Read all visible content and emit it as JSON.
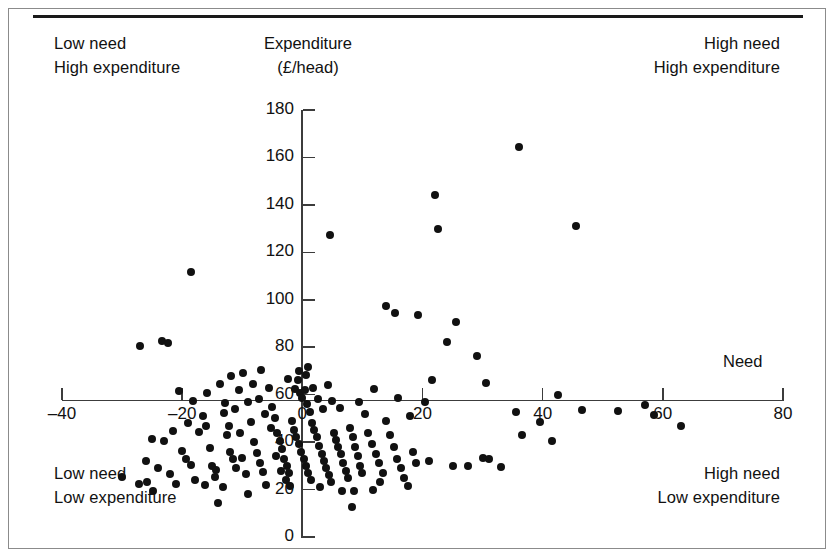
{
  "figure": {
    "annotations": {
      "top_left": [
        "Low need",
        "High expenditure"
      ],
      "top_right": [
        "High need",
        "High expenditure"
      ],
      "bottom_left": [
        "Low need",
        "Low expenditure"
      ],
      "bottom_right": [
        "High need",
        "Low expenditure"
      ]
    },
    "y_axis_title_line1": "Expenditure",
    "y_axis_title_line2": "(£/head)",
    "x_axis_title": "Need",
    "colors": {
      "marker": "#111111",
      "axis": "#3c3c3c",
      "rule": "#1a1a1a",
      "frame": "#8b8b8b",
      "background": "#ffffff"
    }
  },
  "chart_data": {
    "type": "scatter",
    "title": "",
    "xlabel": "Need",
    "ylabel": "Expenditure (£/head)",
    "xlim": [
      -40,
      80
    ],
    "ylim": [
      0,
      180
    ],
    "xticks": [
      -40,
      -20,
      0,
      20,
      40,
      60,
      80
    ],
    "xtick_labels": [
      "–40",
      "–20",
      "0",
      "20",
      "40",
      "60",
      "80"
    ],
    "yticks": [
      0,
      20,
      40,
      60,
      80,
      100,
      120,
      140,
      160,
      180
    ],
    "ytick_labels": [
      "0",
      "20",
      "40",
      "60",
      "80",
      "100",
      "120",
      "140",
      "160",
      "180"
    ],
    "grid": false,
    "legend": null,
    "quadrant_origin": {
      "x": 0,
      "y": 50
    },
    "series": [
      {
        "name": "Health authorities",
        "marker": "filled-circle",
        "color": "#111111",
        "points": [
          [
            -27.0,
            80.5
          ],
          [
            -23.4,
            82.5
          ],
          [
            -22.3,
            81.8
          ],
          [
            -18.6,
            111.5
          ],
          [
            -19.0,
            48.0
          ],
          [
            -25.1,
            41.5
          ],
          [
            -23.0,
            40.6
          ],
          [
            -21.5,
            44.8
          ],
          [
            -20.0,
            36.4
          ],
          [
            -19.3,
            33.0
          ],
          [
            -18.5,
            30.5
          ],
          [
            -17.2,
            44.4
          ],
          [
            -16.6,
            50.8
          ],
          [
            -16.0,
            47.0
          ],
          [
            -15.4,
            37.6
          ],
          [
            -15.0,
            30.0
          ],
          [
            -14.3,
            28.2
          ],
          [
            -13.7,
            64.5
          ],
          [
            -13.0,
            52.3
          ],
          [
            -12.5,
            43.1
          ],
          [
            -12.0,
            36.0
          ],
          [
            -11.6,
            32.8
          ],
          [
            -11.0,
            29.0
          ],
          [
            -10.3,
            43.9
          ],
          [
            -10.0,
            33.5
          ],
          [
            -9.4,
            26.5
          ],
          [
            -9.0,
            57.0
          ],
          [
            -8.6,
            48.5
          ],
          [
            -8.0,
            40.0
          ],
          [
            -7.6,
            35.6
          ],
          [
            -7.0,
            31.0
          ],
          [
            -6.5,
            27.2
          ],
          [
            -6.0,
            22.0
          ],
          [
            -5.5,
            63.0
          ],
          [
            -5.0,
            55.0
          ],
          [
            -4.6,
            50.0
          ],
          [
            -4.2,
            44.0
          ],
          [
            -3.8,
            40.5
          ],
          [
            -3.4,
            37.0
          ],
          [
            -3.0,
            33.0
          ],
          [
            -2.6,
            30.0
          ],
          [
            -2.2,
            26.8
          ],
          [
            -1.8,
            49.0
          ],
          [
            -1.4,
            45.0
          ],
          [
            -1.0,
            42.0
          ],
          [
            -0.6,
            39.0
          ],
          [
            -0.2,
            36.0
          ],
          [
            0.2,
            33.0
          ],
          [
            0.6,
            30.0
          ],
          [
            1.0,
            27.0
          ],
          [
            1.4,
            24.0
          ],
          [
            -0.4,
            60.5
          ],
          [
            0.0,
            58.5
          ],
          [
            0.4,
            62.0
          ],
          [
            0.8,
            56.0
          ],
          [
            1.2,
            52.5
          ],
          [
            1.6,
            48.0
          ],
          [
            2.0,
            45.0
          ],
          [
            2.4,
            42.0
          ],
          [
            2.8,
            38.5
          ],
          [
            3.2,
            35.0
          ],
          [
            3.6,
            32.0
          ],
          [
            4.0,
            29.0
          ],
          [
            4.4,
            26.0
          ],
          [
            4.8,
            23.0
          ],
          [
            5.2,
            44.0
          ],
          [
            5.6,
            41.0
          ],
          [
            6.0,
            38.0
          ],
          [
            6.4,
            35.0
          ],
          [
            6.8,
            31.0
          ],
          [
            7.2,
            28.0
          ],
          [
            7.6,
            25.0
          ],
          [
            8.0,
            46.0
          ],
          [
            8.4,
            42.0
          ],
          [
            8.8,
            38.0
          ],
          [
            9.2,
            34.0
          ],
          [
            9.6,
            30.0
          ],
          [
            10.0,
            27.0
          ],
          [
            10.4,
            52.0
          ],
          [
            11.0,
            44.0
          ],
          [
            11.6,
            39.0
          ],
          [
            12.2,
            35.0
          ],
          [
            12.8,
            31.0
          ],
          [
            13.4,
            27.0
          ],
          [
            14.0,
            49.0
          ],
          [
            14.6,
            43.0
          ],
          [
            15.2,
            38.0
          ],
          [
            15.8,
            33.0
          ],
          [
            16.4,
            29.0
          ],
          [
            17.0,
            25.0
          ],
          [
            17.6,
            21.5
          ],
          [
            18.4,
            36.0
          ],
          [
            19.0,
            31.0
          ],
          [
            20.4,
            57.0
          ],
          [
            21.0,
            32.0
          ],
          [
            -24.0,
            29.0
          ],
          [
            -26.0,
            32.0
          ],
          [
            -22.0,
            26.5
          ],
          [
            -21.0,
            22.5
          ],
          [
            -17.8,
            24.0
          ],
          [
            -16.2,
            22.0
          ],
          [
            -14.6,
            25.5
          ],
          [
            -13.2,
            21.0
          ],
          [
            -12.2,
            47.0
          ],
          [
            -11.2,
            54.0
          ],
          [
            -10.6,
            62.0
          ],
          [
            -9.8,
            69.0
          ],
          [
            -8.2,
            64.5
          ],
          [
            -7.2,
            58.0
          ],
          [
            -6.2,
            52.0
          ],
          [
            -5.2,
            46.0
          ],
          [
            -4.4,
            34.0
          ],
          [
            -3.6,
            28.0
          ],
          [
            -2.8,
            24.0
          ],
          [
            -2.0,
            21.5
          ],
          [
            -1.2,
            62.5
          ],
          [
            -0.8,
            66.0
          ],
          [
            0.6,
            68.5
          ],
          [
            1.8,
            63.0
          ],
          [
            2.6,
            58.0
          ],
          [
            3.4,
            54.0
          ],
          [
            5.0,
            57.5
          ],
          [
            6.2,
            54.5
          ],
          [
            -12.8,
            56.5
          ],
          [
            -15.8,
            60.5
          ],
          [
            -18.2,
            57.5
          ],
          [
            -20.6,
            61.5
          ],
          [
            -9.0,
            18.0
          ],
          [
            3.0,
            21.0
          ],
          [
            6.6,
            19.5
          ],
          [
            8.6,
            19.5
          ],
          [
            11.8,
            20.0
          ],
          [
            13.0,
            23.0
          ],
          [
            -14.0,
            14.5
          ],
          [
            8.2,
            12.5
          ],
          [
            -24.8,
            19.5
          ],
          [
            -27.2,
            22.5
          ],
          [
            -25.8,
            23.0
          ],
          [
            -0.6,
            70.0
          ],
          [
            4.2,
            64.0
          ],
          [
            1.0,
            71.5
          ],
          [
            -2.4,
            66.5
          ],
          [
            12.0,
            62.5
          ],
          [
            9.4,
            57.0
          ],
          [
            -6.8,
            70.5
          ],
          [
            -11.8,
            68.0
          ],
          [
            16.0,
            58.5
          ],
          [
            18.0,
            51.0
          ],
          [
            4.6,
            127.5
          ],
          [
            14.0,
            97.5
          ],
          [
            15.5,
            94.5
          ],
          [
            19.3,
            93.5
          ],
          [
            22.0,
            144.0
          ],
          [
            22.5,
            130.0
          ],
          [
            24.0,
            82.0
          ],
          [
            25.5,
            90.5
          ],
          [
            21.5,
            66.0
          ],
          [
            29.0,
            76.5
          ],
          [
            30.5,
            65.0
          ],
          [
            36.0,
            164.5
          ],
          [
            45.5,
            131.0
          ],
          [
            39.5,
            48.5
          ],
          [
            41.5,
            40.5
          ],
          [
            42.5,
            60.0
          ],
          [
            30.0,
            33.5
          ],
          [
            31.0,
            33.0
          ],
          [
            33.0,
            29.5
          ],
          [
            36.5,
            43.0
          ],
          [
            35.5,
            52.5
          ],
          [
            46.5,
            53.5
          ],
          [
            52.5,
            53.0
          ],
          [
            57.0,
            55.5
          ],
          [
            58.5,
            51.5
          ],
          [
            63.0,
            47.0
          ],
          [
            25.0,
            30.0
          ],
          [
            27.5,
            30.0
          ],
          [
            -30.0,
            25.5
          ]
        ]
      }
    ]
  }
}
